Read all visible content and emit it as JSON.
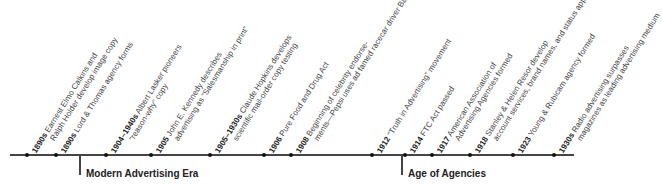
{
  "timeline": {
    "events": [
      {
        "year": "1890s",
        "line1": "Earnest Elmo Calkins and",
        "line2": "Ralph Holder develop image copy",
        "x": 27
      },
      {
        "year": "1890s",
        "line1": "Lord & Thomas agency forms",
        "line2": "",
        "x": 56
      },
      {
        "year": "1904–1940s",
        "line1": "Albert Lasker pioneers",
        "line2": "“reason-why” copy",
        "x": 106
      },
      {
        "year": "1905",
        "line1": "John E. Kennedy describes",
        "line2": "advertising as “Salesmanship in print”",
        "x": 151
      },
      {
        "year": "1905–1930s",
        "line1": "Claude Hopkins develops",
        "line2": "scientific mail-order copy testing",
        "x": 210
      },
      {
        "year": "1906",
        "line1": "Pure Food and Drug Act",
        "line2": "",
        "x": 264
      },
      {
        "year": "1908",
        "line1": "Beginning of celebrity endorse-",
        "line2": "ments—Pepsi uses ad famed racecar driver Barney Oldfield",
        "x": 291
      },
      {
        "year": "1912",
        "line1": "“Truth in Advertising” movement",
        "line2": "",
        "x": 372
      },
      {
        "year": "1914",
        "line1": "FTC Act passed",
        "line2": "",
        "x": 405
      },
      {
        "year": "1917",
        "line1": "American Association of",
        "line2": "Advertising Agencies formed",
        "x": 432
      },
      {
        "year": "1918",
        "line1": "Stanley & Helen Resor develop",
        "line2": "account services, brand names, and status appeals",
        "x": 470
      },
      {
        "year": "1923",
        "line1": "Young & Rubicam agency formed",
        "line2": "",
        "x": 513
      },
      {
        "year": "1930s",
        "line1": "Radio advertising surpasses",
        "line2": "magazines as leading advertising medium",
        "x": 554
      }
    ],
    "eras": [
      {
        "label": "Modern Advertising Era",
        "x": 80
      },
      {
        "label": "Age of Agencies",
        "x": 402
      }
    ]
  }
}
